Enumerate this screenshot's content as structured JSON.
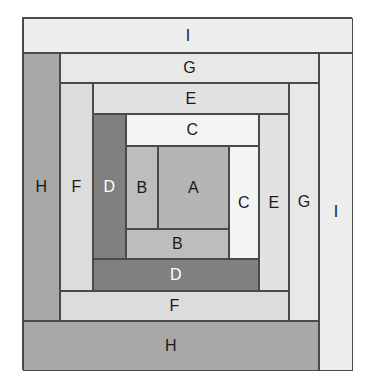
{
  "figure": {
    "background_color": "#ffffff",
    "frame": {
      "border_color": "#4a4a4a",
      "x": 22,
      "y": 17,
      "width": 330,
      "height": 353
    },
    "label_colors": {
      "dark": "#1a1a1a",
      "light": "#ffffff"
    },
    "palette": {
      "A": "#b5b5b5",
      "B": "#bdbdbd",
      "C": "#f4f4f4",
      "D": "#808080",
      "E": "#e2e2e2",
      "F": "#dcdcdc",
      "G": "#e8e8e8",
      "H": "#a8a8a8",
      "I": "#eeeeee"
    },
    "cells": [
      {
        "id": "I-top",
        "label": "I",
        "fill": "#eeeeee",
        "text": "dark",
        "x": 0,
        "y": 0,
        "width": 330,
        "height": 35
      },
      {
        "id": "I-right",
        "label": "I",
        "fill": "#eeeeee",
        "text": "dark",
        "x": 296,
        "y": 35,
        "width": 34,
        "height": 318
      },
      {
        "id": "H-left",
        "label": "H",
        "fill": "#a8a8a8",
        "text": "dark",
        "x": 0,
        "y": 35,
        "width": 37,
        "height": 268
      },
      {
        "id": "H-bottom",
        "label": "H",
        "fill": "#a8a8a8",
        "text": "dark",
        "x": 0,
        "y": 303,
        "width": 296,
        "height": 50
      },
      {
        "id": "G-top",
        "label": "G",
        "fill": "#e8e8e8",
        "text": "dark",
        "x": 37,
        "y": 35,
        "width": 259,
        "height": 30
      },
      {
        "id": "G-right",
        "label": "G",
        "fill": "#e8e8e8",
        "text": "dark",
        "x": 266,
        "y": 65,
        "width": 30,
        "height": 238
      },
      {
        "id": "F-left",
        "label": "F",
        "fill": "#dcdcdc",
        "text": "dark",
        "x": 37,
        "y": 65,
        "width": 33,
        "height": 208
      },
      {
        "id": "F-bottom",
        "label": "F",
        "fill": "#dcdcdc",
        "text": "dark",
        "x": 37,
        "y": 273,
        "width": 229,
        "height": 30
      },
      {
        "id": "E-top",
        "label": "E",
        "fill": "#e2e2e2",
        "text": "dark",
        "x": 70,
        "y": 65,
        "width": 196,
        "height": 31
      },
      {
        "id": "E-right",
        "label": "E",
        "fill": "#e2e2e2",
        "text": "dark",
        "x": 236,
        "y": 96,
        "width": 30,
        "height": 177
      },
      {
        "id": "D-left",
        "label": "D",
        "fill": "#808080",
        "text": "light",
        "x": 70,
        "y": 96,
        "width": 33,
        "height": 145
      },
      {
        "id": "D-bottom",
        "label": "D",
        "fill": "#808080",
        "text": "light",
        "x": 70,
        "y": 241,
        "width": 166,
        "height": 32
      },
      {
        "id": "C-top",
        "label": "C",
        "fill": "#f4f4f4",
        "text": "dark",
        "x": 103,
        "y": 96,
        "width": 133,
        "height": 32
      },
      {
        "id": "C-right",
        "label": "C",
        "fill": "#f4f4f4",
        "text": "dark",
        "x": 206,
        "y": 128,
        "width": 30,
        "height": 113
      },
      {
        "id": "B-left",
        "label": "B",
        "fill": "#bdbdbd",
        "text": "dark",
        "x": 103,
        "y": 128,
        "width": 32,
        "height": 83
      },
      {
        "id": "B-bottom",
        "label": "B",
        "fill": "#bdbdbd",
        "text": "dark",
        "x": 103,
        "y": 211,
        "width": 103,
        "height": 30
      },
      {
        "id": "A-center",
        "label": "A",
        "fill": "#b5b5b5",
        "text": "dark",
        "x": 135,
        "y": 128,
        "width": 71,
        "height": 83
      }
    ]
  }
}
